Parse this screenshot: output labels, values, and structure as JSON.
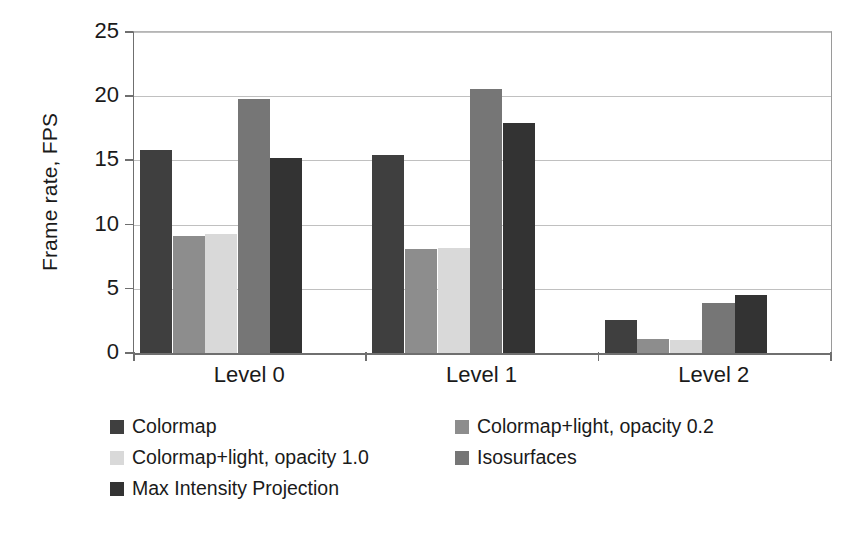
{
  "chart_data": {
    "type": "bar",
    "title": "",
    "subtitle": "",
    "xlabel": "",
    "ylabel": "Frame rate, FPS",
    "categories": [
      "Level 0",
      "Level 1",
      "Level 2"
    ],
    "ylim": [
      0,
      25
    ],
    "yticks": [
      0,
      5,
      10,
      15,
      20,
      25
    ],
    "ytick_labels": [
      "0",
      "5",
      "10",
      "15",
      "20",
      "25"
    ],
    "grid": "horizontal",
    "legend_position": "below",
    "series": [
      {
        "name": "Colormap",
        "color": "#3f3f3f",
        "values": [
          15.8,
          15.4,
          2.6
        ]
      },
      {
        "name": "Colormap+light, opacity 0.2",
        "color": "#8d8d8d",
        "values": [
          9.1,
          8.1,
          1.1
        ]
      },
      {
        "name": "Colormap+light, opacity 1.0",
        "color": "#d9d9d9",
        "values": [
          9.3,
          8.2,
          1.0
        ]
      },
      {
        "name": "Isosurfaces",
        "color": "#767676",
        "values": [
          19.8,
          20.6,
          3.9
        ]
      },
      {
        "name": "Max Intensity Projection",
        "color": "#333333",
        "values": [
          15.2,
          17.9,
          4.5
        ]
      }
    ]
  },
  "legend": {
    "rows": [
      [
        {
          "label": "Colormap",
          "color": "#3f3f3f"
        },
        {
          "label": "Colormap+light, opacity 0.2",
          "color": "#8d8d8d"
        }
      ],
      [
        {
          "label": "Colormap+light, opacity 1.0",
          "color": "#d9d9d9"
        },
        {
          "label": "Isosurfaces",
          "color": "#767676"
        }
      ],
      [
        {
          "label": "Max Intensity Projection",
          "color": "#333333"
        }
      ]
    ]
  }
}
